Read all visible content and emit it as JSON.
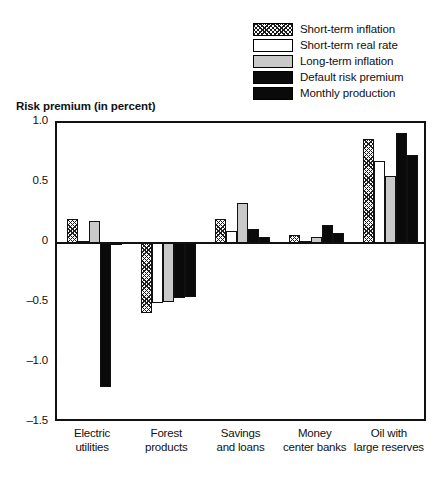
{
  "chart_data": {
    "type": "bar",
    "title": "Risk premium (in percent)",
    "xlabel": "",
    "ylabel": "Risk premium (in percent)",
    "ylim": [
      -1.5,
      1.0
    ],
    "yticks": [
      1.0,
      0.5,
      0,
      -0.5,
      -1.0,
      -1.5
    ],
    "ytick_labels": [
      "1.0",
      "0.5",
      "0",
      "-0.5",
      "-1.0",
      "-1.5"
    ],
    "grid": false,
    "legend_position": "top-right",
    "zero_line": true,
    "categories": [
      "Electric utilities",
      "Forest products",
      "Savings and loans",
      "Money center banks",
      "Oil with large reserves"
    ],
    "category_lines": [
      [
        "Electric",
        "utilities"
      ],
      [
        "Forest",
        "products"
      ],
      [
        "Savings",
        "and loans"
      ],
      [
        "Money",
        "center banks"
      ],
      [
        "Oil with",
        "large reserves"
      ]
    ],
    "series": [
      {
        "name": "Short-term inflation",
        "fill": "hatch",
        "values": [
          0.2,
          -0.58,
          0.2,
          0.07,
          0.87
        ]
      },
      {
        "name": "Short-term real rate",
        "fill": "white",
        "values": [
          0.02,
          -0.5,
          0.1,
          0.02,
          0.68
        ]
      },
      {
        "name": "Long-term inflation",
        "fill": "gray",
        "values": [
          0.18,
          -0.49,
          0.33,
          0.05,
          0.56
        ]
      },
      {
        "name": "Default risk premium",
        "fill": "black",
        "values": [
          -1.2,
          -0.46,
          0.12,
          0.15,
          0.92
        ]
      },
      {
        "name": "Monthly production",
        "fill": "black",
        "values": [
          0.0,
          -0.45,
          0.05,
          0.08,
          0.73
        ]
      }
    ]
  }
}
